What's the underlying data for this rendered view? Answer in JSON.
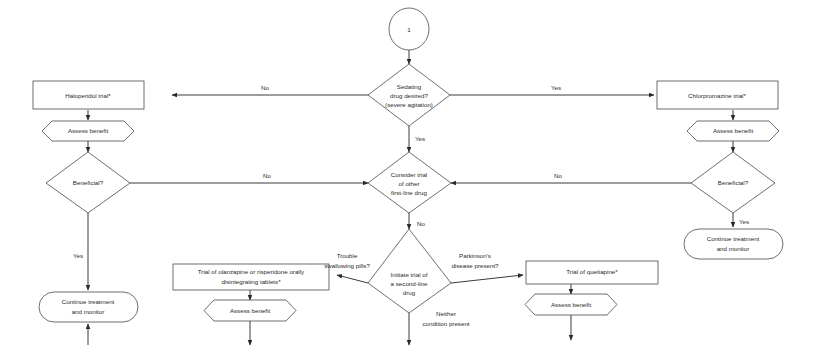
{
  "diagram": {
    "background_color": "#ffffff",
    "line_color": "#3a3a3a",
    "text_color": "#2a2a2a",
    "nodes": {
      "start_circle": "1",
      "sedating_decision_line1": "Sedating",
      "sedating_decision_line2": "drug desired?",
      "sedating_decision_line3": "(severe agitation)",
      "haloperidol": "Haloperidol trial*",
      "chlorpromazine": "Chlorpromazine trial*",
      "assess_benefit_left": "Assess benefit",
      "assess_benefit_right": "Assess benefit",
      "beneficial_left": "Beneficial?",
      "beneficial_right": "Beneficial?",
      "continue_left_line1": "Continue treatment",
      "continue_left_line2": "and monitor",
      "continue_right_line1": "Continue treatment",
      "continue_right_line2": "and monitor",
      "consider_trial_line1": "Consider trial",
      "consider_trial_line2": "of other",
      "consider_trial_line3": "first-line drug",
      "second_line_line1": "Initiate trial of",
      "second_line_line2": "a second-line",
      "second_line_line3": "drug",
      "olanzapine_line1": "Trial of olanzapine or risperidone orally",
      "olanzapine_line2": "disintegrating tablets*",
      "quetiapine": "Trial of quetiapine*",
      "assess_benefit_olanzapine": "Assess benefit",
      "assess_benefit_quetiapine": "Assess benefit"
    },
    "edge_labels": {
      "sedating_no": "No",
      "sedating_yes_right": "Yes",
      "sedating_yes_down": "Yes",
      "beneficial_left_no": "No",
      "beneficial_left_yes": "Yes",
      "beneficial_right_no": "No",
      "beneficial_right_yes": "Yes",
      "consider_trial_no": "No",
      "trouble_line1": "Trouble",
      "trouble_line2": "swallowing pills?",
      "parkinsons_line1": "Parkinson's",
      "parkinsons_line2": "disease present?",
      "neither_line1": "Neither",
      "neither_line2": "condition present"
    }
  }
}
